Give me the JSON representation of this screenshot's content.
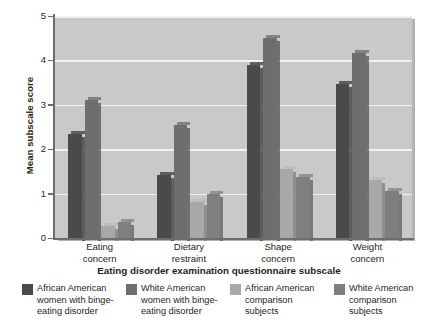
{
  "chart_data": {
    "type": "bar",
    "title": "",
    "xlabel": "Eating disorder examination questionnaire subscale",
    "ylabel": "Mean subscale score",
    "categories": [
      "Eating\nconcern",
      "Dietary\nrestraint",
      "Shape\nconcern",
      "Weight\nconcern"
    ],
    "category_lines": [
      [
        "Eating",
        "concern"
      ],
      [
        "Dietary",
        "restraint"
      ],
      [
        "Shape",
        "concern"
      ],
      [
        "Weight",
        "concern"
      ]
    ],
    "ylim": [
      0,
      5
    ],
    "yticks": [
      0,
      1,
      2,
      3,
      4,
      5
    ],
    "ytick_labels": [
      "0",
      "1",
      "2",
      "3",
      "4",
      "5"
    ],
    "grid": true,
    "grid_color": "#f2f2f2",
    "plot_background": "#c9c9c9",
    "legend_position": "bottom",
    "series": [
      {
        "name": "African American women with binge-eating disorder",
        "legend_lines": [
          "African American",
          "women with binge-",
          "eating disorder"
        ],
        "color": "#4a4a4a",
        "values": [
          2.35,
          1.42,
          3.9,
          3.48
        ]
      },
      {
        "name": "White American women with binge-eating disorder",
        "legend_lines": [
          "White American",
          "women with binge-",
          "eating disorder"
        ],
        "color": "#6e6e6e",
        "values": [
          3.1,
          2.55,
          4.5,
          4.17
        ]
      },
      {
        "name": "African American comparison subjects",
        "legend_lines": [
          "African American",
          "comparison",
          "subjects"
        ],
        "color": "#a8a8a8",
        "values": [
          0.27,
          0.8,
          1.55,
          1.3
        ]
      },
      {
        "name": "White American comparison subjects",
        "legend_lines": [
          "White American",
          "comparison",
          "subjects"
        ],
        "color": "#7f7f7f",
        "values": [
          0.35,
          1.0,
          1.38,
          1.07
        ]
      }
    ]
  }
}
